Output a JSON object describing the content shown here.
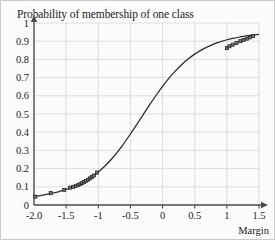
{
  "chart_data": {
    "type": "line",
    "title": "Probability of membership of one class",
    "xlabel": "Margin",
    "ylabel": "",
    "xlim": [
      -2.0,
      1.5
    ],
    "ylim": [
      0,
      1
    ],
    "grid": true,
    "legend": null,
    "xticks": [
      "-2.0",
      "-1.5",
      "-1",
      "-0.5",
      "0",
      "0.5",
      "1",
      "1.5"
    ],
    "xtick_values": [
      -2.0,
      -1.5,
      -1.0,
      -0.5,
      0,
      0.5,
      1.0,
      1.5
    ],
    "yticks": [
      "0",
      "0.1",
      "0.2",
      "0.3",
      "0.4",
      "0.5",
      "0.6",
      "0.7",
      "0.8",
      "0.9",
      "1"
    ],
    "ytick_values": [
      0,
      0.1,
      0.2,
      0.3,
      0.4,
      0.5,
      0.6,
      0.7,
      0.8,
      0.9,
      1.0
    ],
    "series": [
      {
        "name": "sigmoid-fit",
        "type": "line",
        "x": [
          -2.0,
          -1.9,
          -1.8,
          -1.7,
          -1.6,
          -1.5,
          -1.4,
          -1.3,
          -1.2,
          -1.1,
          -1.0,
          -0.9,
          -0.8,
          -0.7,
          -0.6,
          -0.5,
          -0.4,
          -0.3,
          -0.2,
          -0.1,
          0.0,
          0.1,
          0.2,
          0.3,
          0.4,
          0.5,
          0.6,
          0.7,
          0.8,
          0.9,
          1.0,
          1.1,
          1.2,
          1.3,
          1.4,
          1.5
        ],
        "y": [
          0.046,
          0.052,
          0.058,
          0.066,
          0.075,
          0.086,
          0.099,
          0.114,
          0.132,
          0.154,
          0.181,
          0.213,
          0.25,
          0.292,
          0.339,
          0.39,
          0.443,
          0.497,
          0.551,
          0.603,
          0.652,
          0.697,
          0.737,
          0.772,
          0.803,
          0.829,
          0.851,
          0.869,
          0.885,
          0.897,
          0.908,
          0.916,
          0.923,
          0.929,
          0.933,
          0.937
        ]
      },
      {
        "name": "data-points",
        "type": "scatter",
        "marker": "square",
        "x": [
          -1.98,
          -1.74,
          -1.53,
          -1.44,
          -1.39,
          -1.35,
          -1.31,
          -1.28,
          -1.25,
          -1.22,
          -1.19,
          -1.16,
          -1.13,
          -1.1,
          -1.07,
          -1.02,
          1.0,
          1.04,
          1.09,
          1.15,
          1.21,
          1.26,
          1.31,
          1.36,
          1.41
        ],
        "y": [
          0.046,
          0.065,
          0.083,
          0.095,
          0.1,
          0.105,
          0.11,
          0.115,
          0.12,
          0.126,
          0.132,
          0.139,
          0.146,
          0.154,
          0.162,
          0.178,
          0.862,
          0.872,
          0.881,
          0.89,
          0.9,
          0.907,
          0.914,
          0.921,
          0.928
        ]
      }
    ]
  },
  "axis": {
    "x_arrow": true,
    "y_arrow": true
  },
  "colors": {
    "curve": "#2b2b2b",
    "grid": "#d8d8d8",
    "axis": "#4a4a4a",
    "marker_fill": "#6e6e6e",
    "background": "#fbfbfb",
    "border": "#c9c9c9",
    "text": "#1b1b1b"
  }
}
